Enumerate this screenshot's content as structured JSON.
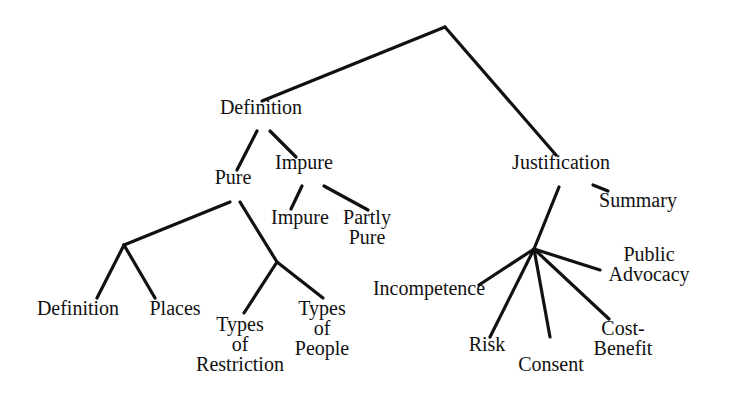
{
  "diagram": {
    "type": "tree",
    "background": "#ffffff",
    "line_color": "#111111",
    "nodes": {
      "definition": {
        "lines": [
          "Definition"
        ],
        "x": 261,
        "y": 107
      },
      "pure": {
        "lines": [
          "Pure"
        ],
        "x": 233,
        "y": 177
      },
      "impure_group": {
        "lines": [
          "Impure"
        ],
        "x": 304,
        "y": 162
      },
      "impure_leaf": {
        "lines": [
          "Impure"
        ],
        "x": 300,
        "y": 217
      },
      "partly_pure": {
        "lines": [
          "Partly",
          "Pure"
        ],
        "x": 367,
        "y": 217
      },
      "def_leaf": {
        "lines": [
          "Definition"
        ],
        "x": 78,
        "y": 308
      },
      "places": {
        "lines": [
          "Places"
        ],
        "x": 175,
        "y": 308
      },
      "types_restriction": {
        "lines": [
          "Types",
          "of",
          "Restriction"
        ],
        "x": 240,
        "y": 324
      },
      "types_people": {
        "lines": [
          "Types",
          "of",
          "People"
        ],
        "x": 322,
        "y": 308
      },
      "justification": {
        "lines": [
          "Justification"
        ],
        "x": 561,
        "y": 162
      },
      "summary": {
        "lines": [
          "Summary"
        ],
        "x": 638,
        "y": 200
      },
      "incompetence": {
        "lines": [
          "Incompetence"
        ],
        "x": 429,
        "y": 288
      },
      "risk": {
        "lines": [
          "Risk"
        ],
        "x": 487,
        "y": 344
      },
      "consent": {
        "lines": [
          "Consent"
        ],
        "x": 551,
        "y": 364
      },
      "cost_benefit": {
        "lines": [
          "Cost-",
          "Benefit"
        ],
        "x": 623,
        "y": 328
      },
      "public_advocacy": {
        "lines": [
          "Public",
          "Advocacy"
        ],
        "x": 649,
        "y": 254
      }
    },
    "edges": [
      [
        445,
        27,
        262,
        101
      ],
      [
        445,
        27,
        556,
        155
      ],
      [
        257,
        131,
        237,
        170
      ],
      [
        270,
        131,
        296,
        157
      ],
      [
        240,
        202,
        277,
        262
      ],
      [
        230,
        202,
        124,
        245
      ],
      [
        124,
        245,
        97,
        298
      ],
      [
        124,
        245,
        155,
        298
      ],
      [
        277,
        262,
        244,
        313
      ],
      [
        277,
        262,
        323,
        298
      ],
      [
        302,
        186,
        291,
        209
      ],
      [
        324,
        186,
        368,
        210
      ],
      [
        559,
        187,
        534,
        249
      ],
      [
        593,
        185,
        608,
        191
      ],
      [
        534,
        249,
        479,
        285
      ],
      [
        534,
        249,
        490,
        337
      ],
      [
        534,
        249,
        550,
        337
      ],
      [
        534,
        249,
        609,
        319
      ],
      [
        534,
        249,
        600,
        270
      ]
    ]
  }
}
